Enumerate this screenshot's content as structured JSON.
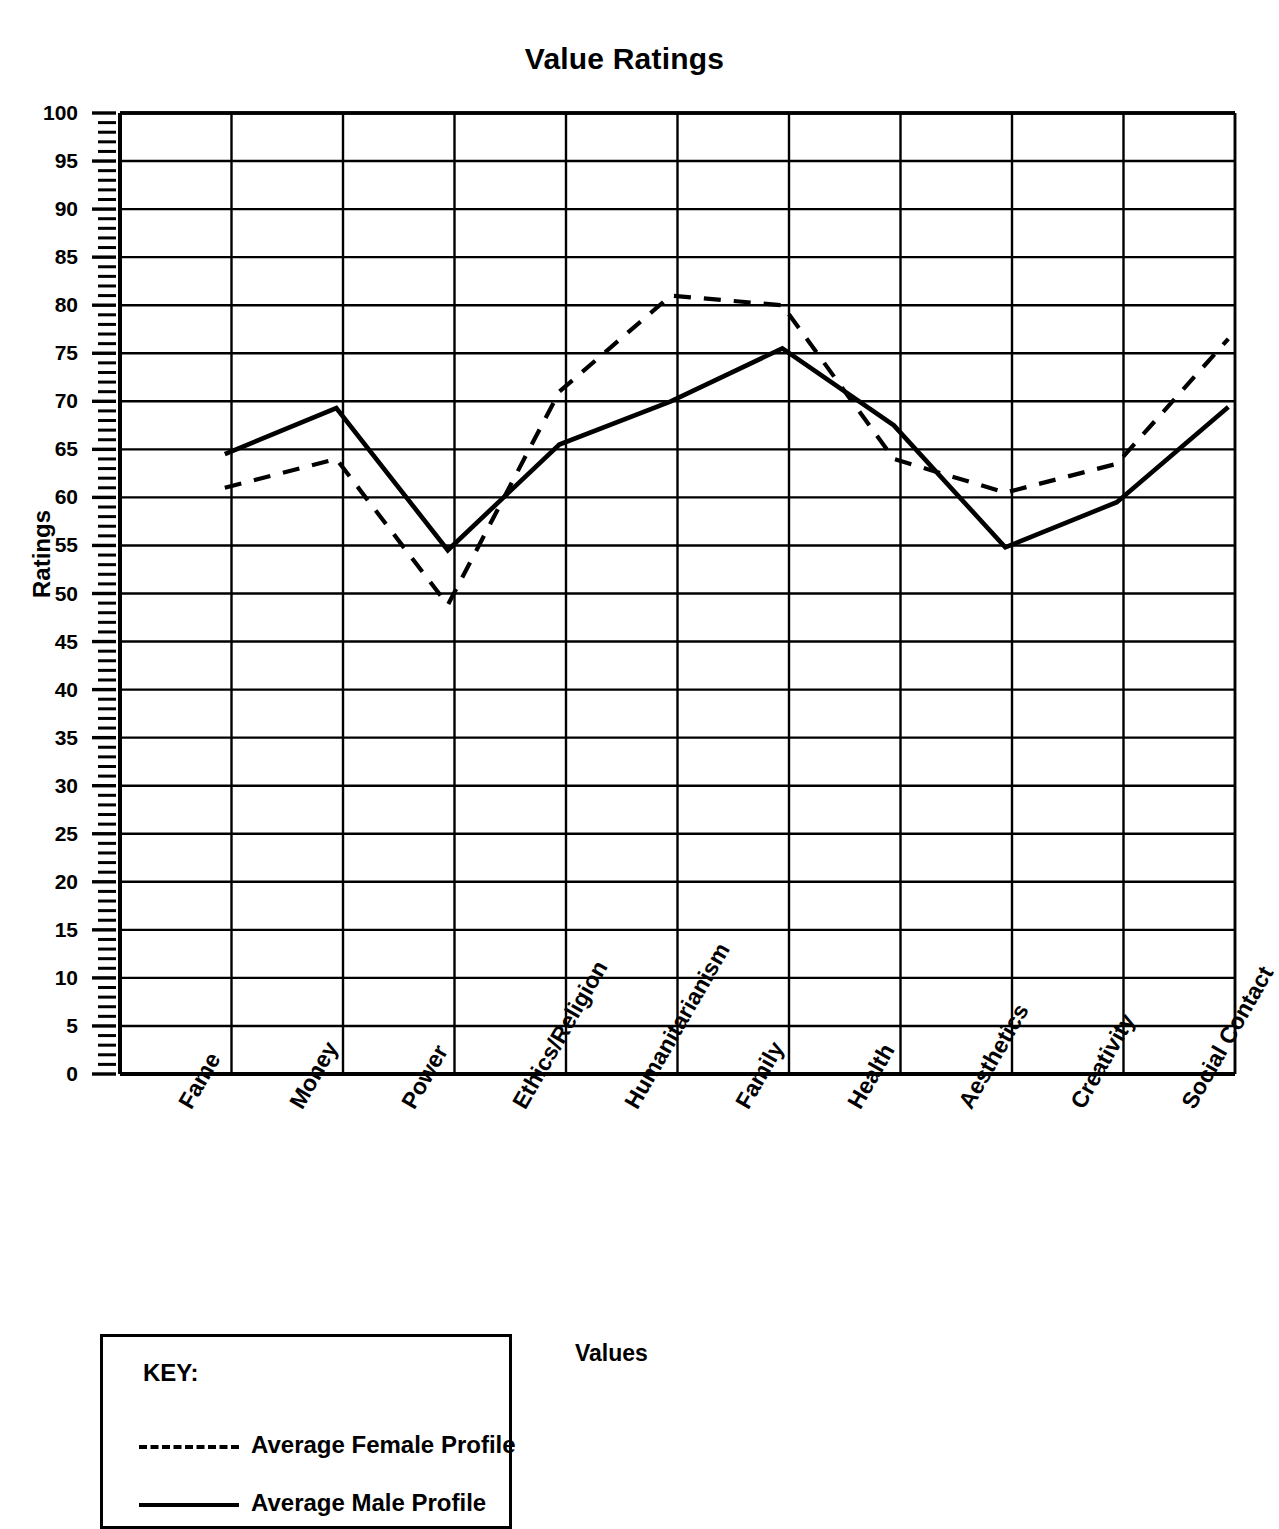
{
  "chart_data": {
    "type": "line",
    "title": "Value Ratings",
    "xlabel": "Values",
    "ylabel": "Ratings",
    "ylim": [
      0,
      100
    ],
    "ytick_step": 5,
    "yminor_step": 1,
    "grid": true,
    "legend_position": "below-left",
    "categories": [
      "Fame",
      "Money",
      "Power",
      "Ethics/Religion",
      "Humanitarianism",
      "Family",
      "Health",
      "Aesthetics",
      "Creativity",
      "Social Contact"
    ],
    "yticks": [
      0,
      5,
      10,
      15,
      20,
      25,
      30,
      35,
      40,
      45,
      50,
      55,
      60,
      65,
      70,
      75,
      80,
      85,
      90,
      95,
      100
    ],
    "series": [
      {
        "name": "Average Female Profile",
        "style": "dashed",
        "color": "#000000",
        "values": [
          61,
          64,
          48.8,
          71,
          81,
          80,
          64,
          60.5,
          63.5,
          76.5
        ]
      },
      {
        "name": "Average Male Profile",
        "style": "solid",
        "color": "#000000",
        "values": [
          64.5,
          69.3,
          54.5,
          65.5,
          70,
          75.5,
          67.5,
          54.8,
          59.5,
          69.4
        ]
      }
    ]
  },
  "legend": {
    "key_title": "KEY:",
    "entries": [
      {
        "label": "Average Female Profile",
        "style": "dashed"
      },
      {
        "label": "Average Male Profile",
        "style": "solid"
      }
    ]
  }
}
